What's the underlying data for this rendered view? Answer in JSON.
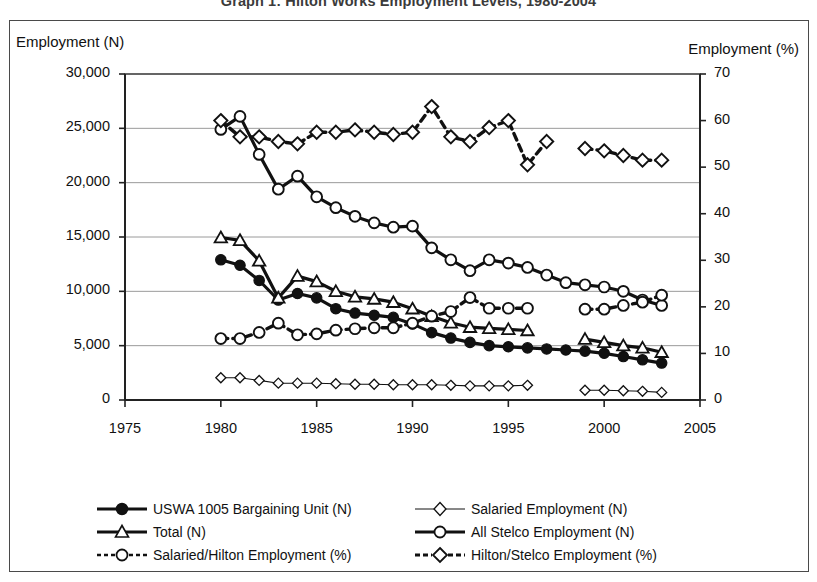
{
  "title": "Graph 1: Hilton Works Employment Levels, 1980-2004",
  "axis": {
    "left_title": "Employment (N)",
    "right_title": "Employment (%)"
  },
  "legend": {
    "items": [
      {
        "label": "USWA 1005 Bargaining Unit (N)",
        "key": "filled-circle-solid"
      },
      {
        "label": "Salaried Employment (N)",
        "key": "open-diamond-thin"
      },
      {
        "label": "Total (N)",
        "key": "open-triangle-solid"
      },
      {
        "label": "All Stelco Employment (N)",
        "key": "open-circle-solid"
      },
      {
        "label": "Salaried/Hilton Employment (%)",
        "key": "open-circle-dashed"
      },
      {
        "label": "Hilton/Stelco Employment (%)",
        "key": "open-diamond-dashed"
      }
    ]
  },
  "chart_data": {
    "type": "line",
    "title": "Graph 1: Hilton Works Employment Levels, 1980-2004",
    "xlabel": "",
    "ylabel": "Employment (N)",
    "y2label": "Employment (%)",
    "xlim": [
      1975,
      2005
    ],
    "ylim": [
      0,
      30000
    ],
    "y2lim": [
      0,
      70
    ],
    "grid": true,
    "legend_position": "bottom",
    "xticks": [
      1975,
      1980,
      1985,
      1990,
      1995,
      2000,
      2005
    ],
    "xtick_labels": [
      "1975",
      "1980",
      "1985",
      "1990",
      "1995",
      "2000",
      "2005"
    ],
    "yticks": [
      0,
      5000,
      10000,
      15000,
      20000,
      25000,
      30000
    ],
    "ytick_labels": [
      "0",
      "5,000",
      "10,000",
      "15,000",
      "20,000",
      "25,000",
      "30,000"
    ],
    "y2ticks": [
      0,
      10,
      20,
      30,
      40,
      50,
      60,
      70
    ],
    "y2tick_labels": [
      "0",
      "10",
      "20",
      "30",
      "40",
      "50",
      "60",
      "70"
    ],
    "series": [
      {
        "name": "USWA 1005 Bargaining Unit (N)",
        "axis": "left",
        "marker": "filled-circle",
        "line": "solid",
        "x": [
          1980,
          1981,
          1982,
          1983,
          1984,
          1985,
          1986,
          1987,
          1988,
          1989,
          1990,
          1991,
          1992,
          1993,
          1994,
          1995,
          1996,
          1997,
          1998,
          1999,
          2000,
          2001,
          2002,
          2003
        ],
        "y": [
          12900,
          12400,
          11000,
          9200,
          9800,
          9400,
          8400,
          8000,
          7800,
          7600,
          7000,
          6200,
          5700,
          5300,
          5000,
          4900,
          4800,
          4700,
          4600,
          4500,
          4300,
          4000,
          3700,
          3400
        ]
      },
      {
        "name": "Salaried Employment (N)",
        "axis": "left",
        "marker": "open-diamond-small",
        "line": "thin-solid",
        "x": [
          1980,
          1981,
          1982,
          1983,
          1984,
          1985,
          1986,
          1987,
          1988,
          1989,
          1990,
          1991,
          1992,
          1993,
          1994,
          1995,
          1996,
          1999,
          2000,
          2001,
          2002,
          2003
        ],
        "y": [
          2050,
          2050,
          1800,
          1550,
          1550,
          1550,
          1500,
          1450,
          1450,
          1400,
          1400,
          1400,
          1350,
          1300,
          1300,
          1300,
          1350,
          900,
          900,
          850,
          800,
          700
        ]
      },
      {
        "name": "Total (N)",
        "axis": "left",
        "marker": "open-triangle",
        "line": "solid",
        "x": [
          1980,
          1981,
          1982,
          1983,
          1984,
          1985,
          1986,
          1987,
          1988,
          1989,
          1990,
          1991,
          1992,
          1993,
          1994,
          1995,
          1996,
          1999,
          2000,
          2001,
          2002,
          2003
        ],
        "y": [
          14950,
          14700,
          12800,
          9400,
          11400,
          10900,
          10000,
          9500,
          9300,
          9000,
          8400,
          7700,
          7100,
          6700,
          6600,
          6500,
          6400,
          5600,
          5300,
          5000,
          4800,
          4400
        ]
      },
      {
        "name": "All Stelco Employment (N)",
        "axis": "left",
        "marker": "open-circle",
        "line": "solid",
        "x": [
          1980,
          1981,
          1982,
          1983,
          1984,
          1985,
          1986,
          1987,
          1988,
          1989,
          1990,
          1991,
          1992,
          1993,
          1994,
          1995,
          1996,
          1997,
          1998,
          1999,
          2000,
          2001,
          2002,
          2003
        ],
        "y": [
          24900,
          26100,
          22600,
          19400,
          20600,
          18700,
          17700,
          16900,
          16300,
          15900,
          16000,
          14000,
          12900,
          11900,
          12900,
          12600,
          12200,
          11500,
          10800,
          10600,
          10400,
          10000,
          9200,
          8700
        ]
      },
      {
        "name": "Salaried/Hilton Employment (%)",
        "axis": "right",
        "marker": "open-circle",
        "line": "dashed",
        "x": [
          1980,
          1981,
          1982,
          1983,
          1984,
          1985,
          1986,
          1987,
          1988,
          1989,
          1990,
          1991,
          1992,
          1993,
          1994,
          1995,
          1996,
          1999,
          2000,
          2001,
          2002,
          2003
        ],
        "y": [
          13.2,
          13.2,
          14.5,
          16.5,
          14.0,
          14.2,
          15.0,
          15.3,
          15.5,
          15.5,
          16.5,
          18.0,
          19.0,
          22.0,
          19.7,
          19.7,
          19.7,
          19.5,
          19.5,
          20.3,
          21.0,
          22.5
        ]
      },
      {
        "name": "Hilton/Stelco Employment (%)",
        "axis": "right",
        "marker": "open-diamond",
        "line": "dashed",
        "x": [
          1980,
          1981,
          1982,
          1983,
          1984,
          1985,
          1986,
          1987,
          1988,
          1989,
          1990,
          1991,
          1992,
          1993,
          1994,
          1995,
          1996,
          1997,
          1999,
          2000,
          2001,
          2002,
          2003
        ],
        "y": [
          60.0,
          56.5,
          56.5,
          55.5,
          55.0,
          57.5,
          57.5,
          58.0,
          57.5,
          57.0,
          57.5,
          63.0,
          56.5,
          55.5,
          58.5,
          60.0,
          50.5,
          55.5,
          54.0,
          53.5,
          52.5,
          51.5,
          51.5
        ]
      }
    ]
  },
  "colors": {
    "ink": "#111111",
    "grid": "#9a9a9a",
    "frame": "#4a4a4a",
    "plot_border": "#3a3a3a"
  }
}
